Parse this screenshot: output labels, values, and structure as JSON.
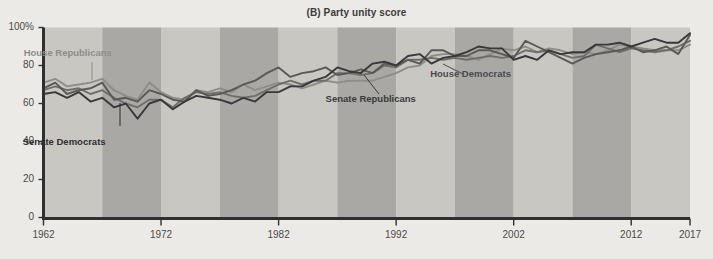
{
  "chart_data": {
    "type": "line",
    "title": "(B) Party unity score",
    "xlabel": "",
    "ylabel": "",
    "xlim": [
      1962,
      2017
    ],
    "ylim": [
      0,
      100
    ],
    "grid": false,
    "legend_position": "inline-annotations",
    "x_ticks": [
      "1962",
      "1972",
      "1982",
      "1992",
      "2002",
      "2012",
      "2017"
    ],
    "x_tick_values": [
      1962,
      1972,
      1982,
      1992,
      2002,
      2012,
      2017
    ],
    "y_ticks": [
      "0",
      "20",
      "40",
      "60",
      "80",
      "100%"
    ],
    "y_tick_values": [
      0,
      20,
      40,
      60,
      80,
      100
    ],
    "background_bands": {
      "note": "alternating shaded 5-year vertical bands",
      "light_color": "#c9c7c2",
      "dark_color": "#a9a8a4",
      "band_years": 5
    },
    "x": [
      1962,
      1963,
      1964,
      1965,
      1966,
      1967,
      1968,
      1969,
      1970,
      1971,
      1972,
      1973,
      1974,
      1975,
      1976,
      1977,
      1978,
      1979,
      1980,
      1981,
      1982,
      1983,
      1984,
      1985,
      1986,
      1987,
      1988,
      1989,
      1990,
      1991,
      1992,
      1993,
      1994,
      1995,
      1996,
      1997,
      1998,
      1999,
      2000,
      2001,
      2002,
      2003,
      2004,
      2005,
      2006,
      2007,
      2008,
      2009,
      2010,
      2011,
      2012,
      2013,
      2014,
      2015,
      2016,
      2017
    ],
    "series": [
      {
        "name": "House Republicans",
        "color": "#8e8d88",
        "values": [
          71,
          73,
          69,
          70,
          71,
          73,
          67,
          64,
          62,
          71,
          66,
          63,
          62,
          67,
          66,
          68,
          66,
          70,
          67,
          69,
          71,
          70,
          68,
          70,
          72,
          71,
          72,
          72,
          72,
          74,
          76,
          79,
          80,
          85,
          86,
          86,
          85,
          83,
          86,
          89,
          88,
          90,
          87,
          89,
          88,
          86,
          87,
          86,
          88,
          91,
          90,
          89,
          88,
          88,
          88,
          91
        ]
      },
      {
        "name": "House Democrats",
        "color": "#6f6e6a",
        "values": [
          67,
          69,
          67,
          68,
          65,
          67,
          63,
          60,
          58,
          62,
          62,
          58,
          63,
          66,
          65,
          66,
          64,
          63,
          64,
          67,
          70,
          72,
          70,
          72,
          72,
          76,
          76,
          75,
          76,
          80,
          79,
          83,
          83,
          84,
          83,
          84,
          83,
          84,
          85,
          84,
          85,
          88,
          87,
          88,
          86,
          84,
          85,
          91,
          89,
          87,
          89,
          88,
          87,
          88,
          90,
          93
        ]
      },
      {
        "name": "Senate Republicans",
        "color": "#5a5955",
        "values": [
          68,
          71,
          65,
          67,
          68,
          71,
          62,
          63,
          61,
          67,
          65,
          62,
          61,
          67,
          64,
          65,
          67,
          70,
          72,
          76,
          79,
          74,
          76,
          77,
          79,
          75,
          76,
          78,
          76,
          81,
          80,
          83,
          81,
          88,
          88,
          85,
          85,
          88,
          88,
          86,
          84,
          93,
          90,
          87,
          84,
          81,
          84,
          86,
          87,
          88,
          90,
          87,
          88,
          90,
          86,
          96
        ]
      },
      {
        "name": "Senate Democrats",
        "color": "#38383a",
        "values": [
          65,
          66,
          63,
          66,
          61,
          63,
          58,
          60,
          52,
          60,
          62,
          57,
          61,
          64,
          63,
          62,
          60,
          63,
          61,
          66,
          66,
          69,
          69,
          72,
          74,
          79,
          77,
          76,
          81,
          82,
          80,
          85,
          86,
          81,
          84,
          85,
          87,
          90,
          89,
          89,
          83,
          85,
          83,
          88,
          86,
          87,
          87,
          91,
          91,
          92,
          90,
          92,
          94,
          92,
          92,
          97
        ]
      }
    ],
    "annotations": [
      {
        "text": "House Republicans",
        "color": "#8e8d88",
        "x_pct": 9.5,
        "y_pct": 20.0
      },
      {
        "text": "Senate Democrats",
        "color": "#2e2e30",
        "x_pct": 9.0,
        "y_pct": 54.5
      },
      {
        "text": "Senate Republicans",
        "color": "#3a3a3c",
        "x_pct": 52.0,
        "y_pct": 38.0
      },
      {
        "text": "House Democrats",
        "color": "#4a4a4c",
        "x_pct": 66.0,
        "y_pct": 28.0
      }
    ]
  }
}
